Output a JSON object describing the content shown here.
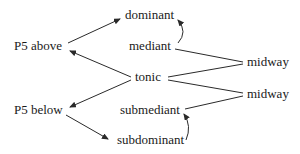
{
  "diagram": {
    "nodes": {
      "dominant": "dominant",
      "mediant": "mediant",
      "tonic": "tonic",
      "submediant": "submediant",
      "subdominant": "subdominant",
      "p5_above": "P5 above",
      "p5_below": "P5 below",
      "midway_upper": "midway",
      "midway_lower": "midway"
    },
    "edges": [
      {
        "from": "P5 above",
        "to": "dominant",
        "type": "arrow"
      },
      {
        "from": "tonic",
        "to": "P5 above",
        "type": "arrow"
      },
      {
        "from": "tonic",
        "to": "P5 below",
        "type": "arrow"
      },
      {
        "from": "P5 below",
        "to": "subdominant",
        "type": "arrow"
      },
      {
        "from": "mediant",
        "to": "dominant",
        "type": "curved-arrow"
      },
      {
        "from": "subdominant",
        "to": "submediant",
        "type": "curved-arrow"
      },
      {
        "from": "mediant",
        "to": "midway (upper)",
        "type": "line"
      },
      {
        "from": "tonic",
        "to": "midway (upper)",
        "type": "line"
      },
      {
        "from": "tonic",
        "to": "midway (lower)",
        "type": "line"
      },
      {
        "from": "submediant",
        "to": "midway (lower)",
        "type": "line"
      }
    ],
    "colors": {
      "text": "#1a1a1a",
      "line": "#2a2a2a",
      "background": "#ffffff"
    }
  }
}
